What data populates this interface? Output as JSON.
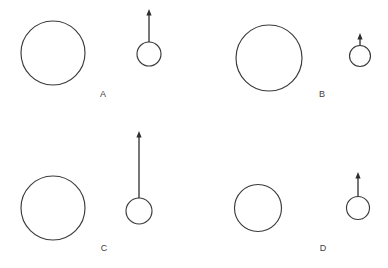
{
  "figure": {
    "background_color": "#ffffff",
    "stroke_color": "#3a3a3a",
    "arrow_color": "#2e2e2e",
    "label_color": "#404040",
    "width": 388,
    "height": 268
  },
  "panels": [
    {
      "label": "A",
      "label_x": 103,
      "label_y": 95,
      "big_circle": {
        "cx": 53,
        "cy": 53,
        "r": 32
      },
      "small_circle": {
        "cx": 149,
        "cy": 54,
        "r": 12
      },
      "arrow": {
        "x": 149,
        "y_tail": 42,
        "y_tip": 9,
        "length": 33
      }
    },
    {
      "label": "B",
      "label_x": 322,
      "label_y": 95,
      "big_circle": {
        "cx": 269,
        "cy": 58,
        "r": 33
      },
      "small_circle": {
        "cx": 360,
        "cy": 56,
        "r": 10.5
      },
      "arrow": {
        "x": 360,
        "y_tail": 45.5,
        "y_tip": 33,
        "length": 12.5
      }
    },
    {
      "label": "C",
      "label_x": 104,
      "label_y": 249,
      "big_circle": {
        "cx": 53,
        "cy": 208,
        "r": 32
      },
      "small_circle": {
        "cx": 139,
        "cy": 211,
        "r": 13
      },
      "arrow": {
        "x": 139,
        "y_tail": 198,
        "y_tip": 131,
        "length": 67
      }
    },
    {
      "label": "D",
      "label_x": 323,
      "label_y": 249,
      "big_circle": {
        "cx": 258,
        "cy": 208,
        "r": 23.5
      },
      "small_circle": {
        "cx": 358,
        "cy": 208,
        "r": 11.5
      },
      "arrow": {
        "x": 358,
        "y_tail": 196.5,
        "y_tip": 172,
        "length": 24.5
      }
    }
  ]
}
